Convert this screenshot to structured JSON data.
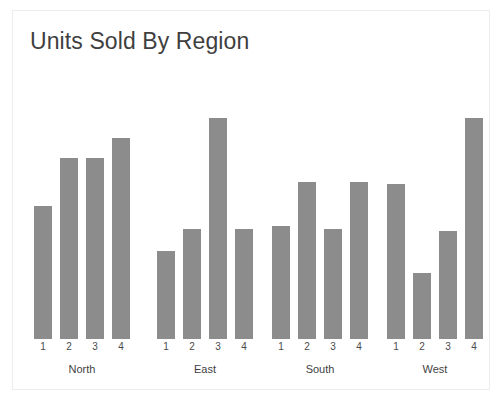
{
  "chart_data": {
    "type": "bar",
    "title": "Units Sold By Region",
    "xlabel": "",
    "ylabel": "",
    "ylim": [
      0,
      100
    ],
    "grid": false,
    "legend": "none",
    "axis_visible": false,
    "bar_color": "#8c8c8c",
    "background_color": "#ffffff",
    "border_color": "#ededed",
    "groups": [
      "North",
      "East",
      "South",
      "West"
    ],
    "categories": [
      "1",
      "2",
      "3",
      "4"
    ],
    "series": [
      {
        "name": "North",
        "values": [
          60,
          82,
          82,
          91
        ]
      },
      {
        "name": "East",
        "values": [
          40,
          50,
          100,
          50
        ]
      },
      {
        "name": "South",
        "values": [
          51,
          71,
          50,
          71
        ]
      },
      {
        "name": "West",
        "values": [
          70,
          30,
          49,
          100
        ]
      }
    ]
  }
}
